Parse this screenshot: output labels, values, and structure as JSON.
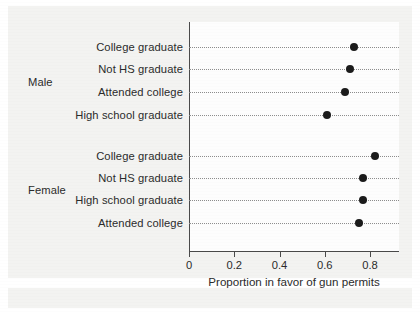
{
  "chart_data": {
    "type": "scatter",
    "subtype": "cleveland-dot-plot",
    "title": "",
    "xlabel": "Proportion in favor of gun permits",
    "ylabel": "",
    "xlim": [
      0,
      0.9
    ],
    "xticks": [
      0,
      0.2,
      0.4,
      0.6,
      0.8
    ],
    "xticklabels": [
      "0",
      "0.2",
      "0.4",
      "0.6",
      "0.8"
    ],
    "grid": "dotted-row-leaders",
    "legend": "none",
    "groups": [
      {
        "name": "Male",
        "categories": [
          "College graduate",
          "Not HS graduate",
          "Attended college",
          "High school graduate"
        ],
        "values": [
          0.73,
          0.71,
          0.69,
          0.61
        ]
      },
      {
        "name": "Female",
        "categories": [
          "College graduate",
          "Not HS graduate",
          "High school graduate",
          "Attended college"
        ],
        "values": [
          0.82,
          0.77,
          0.77,
          0.75
        ]
      }
    ],
    "marker": {
      "shape": "circle",
      "filled": true,
      "color": "#1b1b1b",
      "size_px": 8
    },
    "colors": {
      "marker": "#1b1b1b",
      "axis": "#4a4a4a",
      "leader": "#8d8d8d",
      "text": "#2b2b2b",
      "panel": "#fdfdfd",
      "page": "#f3f3f1"
    }
  },
  "rows": [
    {
      "group": "Male",
      "label": "College graduate",
      "value": 0.73,
      "y": 47
    },
    {
      "group": "Male",
      "label": "Not HS graduate",
      "value": 0.71,
      "y": 69
    },
    {
      "group": "Male",
      "label": "Attended college",
      "value": 0.69,
      "y": 92
    },
    {
      "group": "Male",
      "label": "High school graduate",
      "value": 0.61,
      "y": 115
    },
    {
      "group": "Female",
      "label": "College graduate",
      "value": 0.82,
      "y": 156
    },
    {
      "group": "Female",
      "label": "Not HS graduate",
      "value": 0.77,
      "y": 178
    },
    {
      "group": "Female",
      "label": "High school graduate",
      "value": 0.77,
      "y": 200
    },
    {
      "group": "Female",
      "label": "Attended college",
      "value": 0.75,
      "y": 223
    }
  ],
  "group_labels": [
    {
      "text": "Male",
      "y": 82
    },
    {
      "text": "Female",
      "y": 190
    }
  ],
  "axis": {
    "xlabel": "Proportion in favor of gun permits",
    "ticks": [
      {
        "value": 0,
        "label": "0"
      },
      {
        "value": 0.2,
        "label": "0.2"
      },
      {
        "value": 0.4,
        "label": "0.4"
      },
      {
        "value": 0.6,
        "label": "0.6"
      },
      {
        "value": 0.8,
        "label": "0.8"
      }
    ]
  },
  "geometry": {
    "x0_px": 189,
    "px_per_unit": 226.25,
    "panel_left": 189,
    "panel_top": 22,
    "panel_width": 210,
    "panel_height": 230
  }
}
